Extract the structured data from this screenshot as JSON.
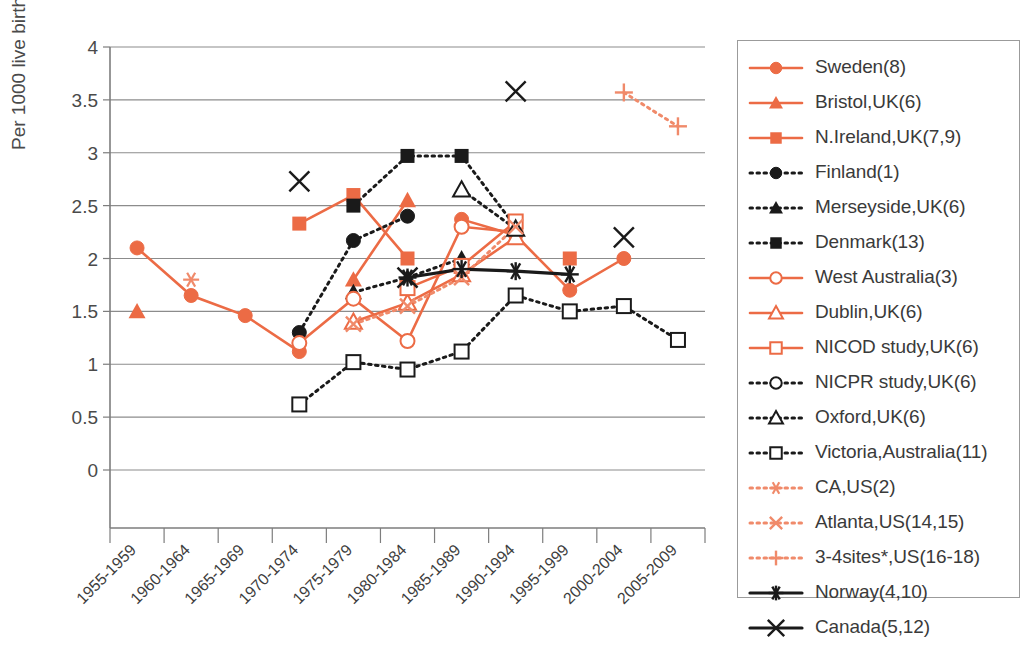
{
  "chart_data": {
    "type": "line",
    "title": "",
    "xlabel": "",
    "ylabel": "Per 1000 live birth",
    "ylim": [
      0,
      4
    ],
    "ytick_values": [
      0,
      0.5,
      1,
      1.5,
      2,
      2.5,
      3,
      3.5,
      4
    ],
    "ytick_labels": [
      "0",
      "0.5",
      "1",
      "1.5",
      "2",
      "2.5",
      "3",
      "3.5",
      "4"
    ],
    "grid": true,
    "legend_position": "right",
    "categories": [
      "1955-1959",
      "1960-1964",
      "1965-1969",
      "1970-1974",
      "1975-1979",
      "1980-1984",
      "1985-1989",
      "1990-1994",
      "1995-1999",
      "2000-2004",
      "2005-2009"
    ],
    "series": [
      {
        "name": "Sweden(8)",
        "color": "#ec6b45",
        "marker": "circle-filled",
        "line": "solid",
        "values": [
          2.1,
          1.65,
          1.46,
          1.12,
          null,
          null,
          2.37,
          2.22,
          1.7,
          2.0,
          null
        ]
      },
      {
        "name": "Bristol,UK(6)",
        "color": "#ec6b45",
        "marker": "triangle-filled",
        "line": "solid",
        "values": [
          1.5,
          null,
          null,
          null,
          1.8,
          2.55,
          null,
          null,
          null,
          null,
          null
        ]
      },
      {
        "name": "N.Ireland,UK(7,9)",
        "color": "#ec6b45",
        "marker": "square-filled",
        "line": "solid",
        "values": [
          null,
          null,
          null,
          2.33,
          2.6,
          2.0,
          null,
          null,
          2.0,
          null,
          null
        ]
      },
      {
        "name": "Finland(1)",
        "color": "#1a1a1a",
        "marker": "circle-filled",
        "line": "dotted",
        "values": [
          null,
          null,
          null,
          1.3,
          2.17,
          2.4,
          null,
          null,
          null,
          null,
          null
        ]
      },
      {
        "name": "Merseyside,UK(6)",
        "color": "#1a1a1a",
        "marker": "triangle-filled",
        "line": "dotted",
        "values": [
          null,
          null,
          null,
          null,
          1.68,
          1.82,
          2.0,
          null,
          null,
          null,
          null
        ]
      },
      {
        "name": "Denmark(13)",
        "color": "#1a1a1a",
        "marker": "square-filled",
        "line": "dotted",
        "values": [
          null,
          null,
          null,
          null,
          2.5,
          2.97,
          2.97,
          2.3,
          null,
          null,
          null
        ]
      },
      {
        "name": "West Australia(3)",
        "color": "#ec6b45",
        "marker": "circle-open",
        "line": "solid",
        "values": [
          null,
          null,
          null,
          1.2,
          1.62,
          1.22,
          2.3,
          2.25,
          null,
          null,
          null
        ]
      },
      {
        "name": "Dublin,UK(6)",
        "color": "#ec6b45",
        "marker": "triangle-open",
        "line": "solid",
        "values": [
          null,
          null,
          null,
          null,
          1.4,
          1.58,
          1.85,
          2.2,
          null,
          null,
          null
        ]
      },
      {
        "name": "NICOD study,UK(6)",
        "color": "#ec6b45",
        "marker": "square-open",
        "line": "solid",
        "values": [
          null,
          null,
          null,
          null,
          null,
          1.72,
          1.93,
          2.35,
          null,
          null,
          null
        ]
      },
      {
        "name": "NICPR study,UK(6)",
        "color": "#1a1a1a",
        "marker": "circle-open",
        "line": "dotted",
        "values": [
          null,
          null,
          null,
          null,
          null,
          null,
          null,
          null,
          null,
          null,
          null
        ]
      },
      {
        "name": "Oxford,UK(6)",
        "color": "#1a1a1a",
        "marker": "triangle-open",
        "line": "dotted",
        "values": [
          null,
          null,
          null,
          null,
          null,
          null,
          2.65,
          2.28,
          null,
          null,
          null
        ]
      },
      {
        "name": "Victoria,Australia(11)",
        "color": "#1a1a1a",
        "marker": "square-open",
        "line": "dotted",
        "values": [
          null,
          null,
          null,
          0.62,
          1.02,
          0.95,
          1.12,
          1.65,
          1.5,
          1.55,
          1.23
        ]
      },
      {
        "name": "CA,US(2)",
        "color": "#f08a6a",
        "marker": "asterisk",
        "line": "dotted",
        "values": [
          null,
          1.8,
          null,
          null,
          null,
          null,
          null,
          null,
          null,
          null,
          null
        ]
      },
      {
        "name": "Atlanta,US(14,15)",
        "color": "#f08a6a",
        "marker": "cross",
        "line": "dotted",
        "values": [
          null,
          null,
          null,
          null,
          1.38,
          1.55,
          1.82,
          2.3,
          null,
          null,
          null
        ]
      },
      {
        "name": "3-4sites*,US(16-18)",
        "color": "#f08a6a",
        "marker": "plus",
        "line": "dotted",
        "values": [
          null,
          null,
          null,
          null,
          null,
          null,
          null,
          null,
          null,
          3.57,
          3.25
        ]
      },
      {
        "name": "Norway(4,10)",
        "color": "#1a1a1a",
        "marker": "star6",
        "line": "solid-thick",
        "values": [
          null,
          null,
          null,
          null,
          null,
          1.82,
          1.9,
          1.88,
          1.85,
          null,
          null
        ]
      },
      {
        "name": "Canada(5,12)",
        "color": "#1a1a1a",
        "marker": "x-large",
        "line": "solid-thick",
        "values": [
          null,
          null,
          null,
          2.73,
          null,
          1.82,
          null,
          3.58,
          null,
          2.2,
          null
        ]
      }
    ]
  },
  "legend": {
    "items": [
      {
        "label": "Sweden(8)"
      },
      {
        "label": "Bristol,UK(6)"
      },
      {
        "label": "N.Ireland,UK(7,9)"
      },
      {
        "label": "Finland(1)"
      },
      {
        "label": "Merseyside,UK(6)"
      },
      {
        "label": "Denmark(13)"
      },
      {
        "label": "West Australia(3)"
      },
      {
        "label": "Dublin,UK(6)"
      },
      {
        "label": "NICOD study,UK(6)"
      },
      {
        "label": "NICPR study,UK(6)"
      },
      {
        "label": "Oxford,UK(6)"
      },
      {
        "label": "Victoria,Australia(11)"
      },
      {
        "label": "CA,US(2)"
      },
      {
        "label": "Atlanta,US(14,15)"
      },
      {
        "label": "3-4sites*,US(16-18)"
      },
      {
        "label": "Norway(4,10)"
      },
      {
        "label": "Canada(5,12)"
      }
    ]
  },
  "colors": {
    "orange": "#ec6b45",
    "orange_light": "#f08a6a",
    "black": "#1a1a1a",
    "grid": "#8c8c8c",
    "axis": "#7d7d7d",
    "text": "#3a3a3a"
  }
}
